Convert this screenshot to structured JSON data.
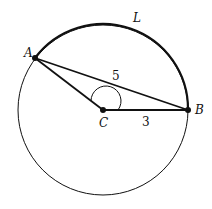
{
  "diagram": {
    "labels": {
      "A": "A",
      "B": "B",
      "C": "C",
      "L": "L",
      "chord_AB": "5",
      "radius_CB": "3"
    },
    "colors": {
      "stroke": "#111111",
      "background": "#ffffff"
    }
  }
}
